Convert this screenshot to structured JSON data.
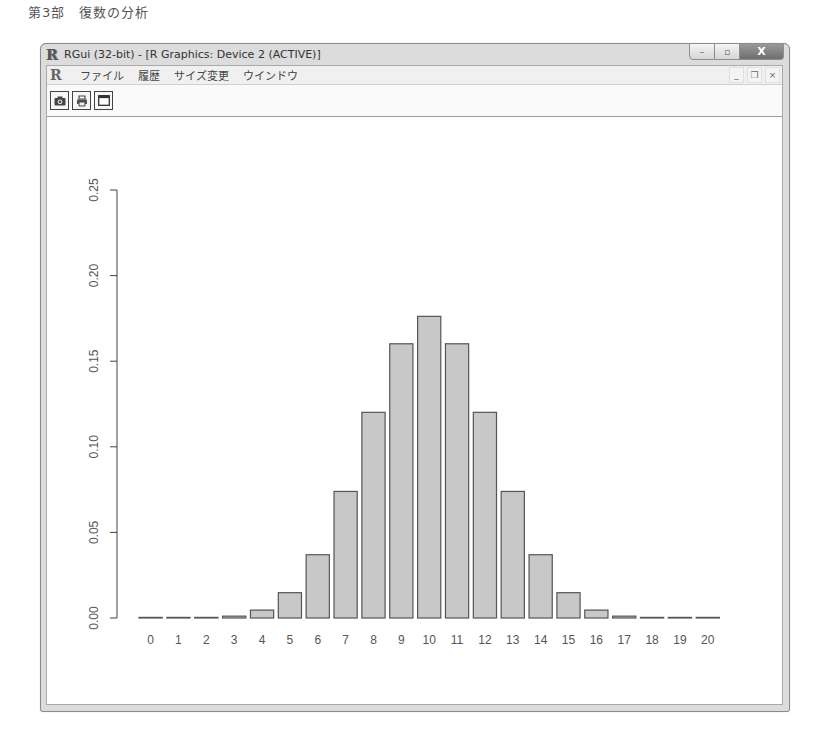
{
  "page_header": "第3部　復数の分析",
  "window": {
    "title": "RGui (32-bit) - [R Graphics: Device 2 (ACTIVE)]",
    "controls": {
      "minimize": "–",
      "maximize": "▫",
      "close": "X"
    }
  },
  "menubar": {
    "items": [
      {
        "label": "ファイル"
      },
      {
        "label": "履歴"
      },
      {
        "label": "サイズ変更"
      },
      {
        "label": "ウインドウ"
      }
    ],
    "mdi_controls": {
      "minimize": "_",
      "restore": "❐",
      "close": "×"
    }
  },
  "toolbar": {
    "buttons": [
      {
        "name": "copy-as-metafile",
        "icon": "camera-icon",
        "glyph": "◙"
      },
      {
        "name": "print",
        "icon": "printer-icon",
        "glyph": "⎙"
      },
      {
        "name": "new-window",
        "icon": "window-icon",
        "glyph": "▭"
      }
    ]
  },
  "chart_data": {
    "type": "bar",
    "title": "",
    "xlabel": "",
    "ylabel": "",
    "categories": [
      "0",
      "1",
      "2",
      "3",
      "4",
      "5",
      "6",
      "7",
      "8",
      "9",
      "10",
      "11",
      "12",
      "13",
      "14",
      "15",
      "16",
      "17",
      "18",
      "19",
      "20"
    ],
    "values": [
      1e-06,
      1.9e-05,
      0.000181,
      0.001087,
      0.004621,
      0.014786,
      0.036964,
      0.073929,
      0.120134,
      0.160179,
      0.176197,
      0.160179,
      0.120134,
      0.073929,
      0.036964,
      0.014786,
      0.004621,
      0.001087,
      0.000181,
      1.9e-05,
      1e-06
    ],
    "ylim": [
      0,
      0.25
    ],
    "yticks": [
      "0.00",
      "0.05",
      "0.10",
      "0.15",
      "0.20",
      "0.25"
    ],
    "ytick_values": [
      0,
      0.05,
      0.1,
      0.15,
      0.2,
      0.25
    ],
    "grid": false,
    "legend": null,
    "bar_fill": "#c8c8c8",
    "bar_stroke": "#555555"
  }
}
